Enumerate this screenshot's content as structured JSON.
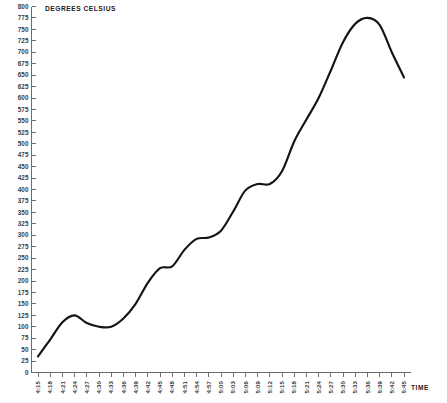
{
  "chart_data": {
    "type": "line",
    "title": "",
    "ylabel": "DEGREES CELSIUS",
    "xlabel": "TIME",
    "grid": false,
    "legend": false,
    "ylim": [
      0,
      800
    ],
    "ytick_step": 25,
    "ytick_labels": [
      "0",
      "25",
      "50",
      "75",
      "100",
      "125",
      "150",
      "175",
      "200",
      "225",
      "250",
      "275",
      "300",
      "325",
      "350",
      "375",
      "400",
      "425",
      "450",
      "475",
      "500",
      "525",
      "550",
      "575",
      "600",
      "625",
      "650",
      "675",
      "700",
      "725",
      "750",
      "775",
      "800"
    ],
    "categories": [
      "4:15",
      "4:18",
      "4:21",
      "4:24",
      "4:27",
      "4:30",
      "4:33",
      "4:36",
      "4:39",
      "4:42",
      "4:45",
      "4:48",
      "4:51",
      "4:54",
      "4:57",
      "5:00",
      "5:03",
      "5:06",
      "5:09",
      "5:12",
      "5:15",
      "5:18",
      "5:21",
      "5:24",
      "5:27",
      "5:30",
      "5:33",
      "5:36",
      "5:39",
      "5:42",
      "5:45"
    ],
    "series": [
      {
        "name": "Temperature",
        "color": "#141414",
        "values": [
          35,
          72,
          110,
          125,
          108,
          100,
          100,
          118,
          150,
          196,
          228,
          232,
          268,
          292,
          295,
          310,
          352,
          398,
          412,
          412,
          440,
          505,
          553,
          600,
          660,
          722,
          762,
          775,
          760,
          700,
          645
        ]
      }
    ],
    "series_x_end_label": "5:27",
    "series_points_count": 31
  },
  "axis": {
    "y_title": "DEGREES CELSIUS",
    "x_title": "TIME"
  },
  "colors": {
    "line": "#141414",
    "axis": "#6d6d6d",
    "label": "#3a3a3a",
    "background": "#ffffff"
  }
}
